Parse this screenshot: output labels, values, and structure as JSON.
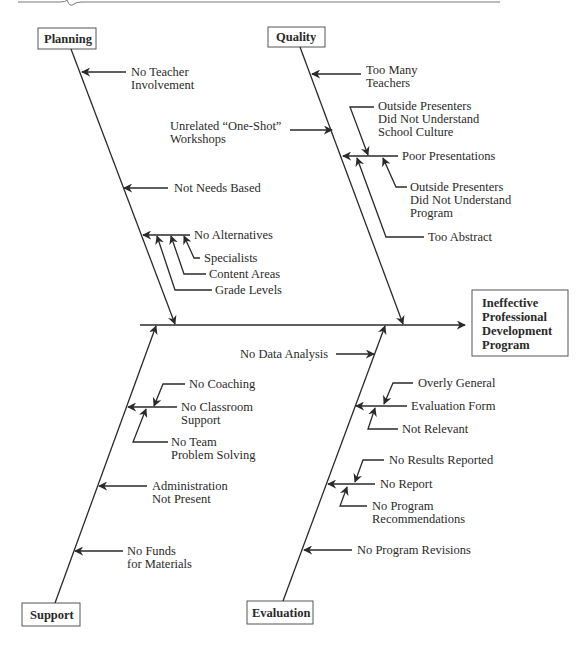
{
  "diagram": {
    "type": "fishbone",
    "effect": {
      "lines": [
        "Ineffective",
        "Professional",
        "Development",
        "Program"
      ]
    },
    "categories": {
      "planning": {
        "label": "Planning",
        "causes": [
          {
            "lines": [
              "No Teacher",
              "Involvement"
            ]
          },
          {
            "lines": [
              "Not Needs Based"
            ]
          },
          {
            "lines": [
              "No Alternatives"
            ],
            "sub_causes": [
              {
                "lines": [
                  "Specialists"
                ]
              },
              {
                "lines": [
                  "Content Areas"
                ]
              },
              {
                "lines": [
                  "Grade Levels"
                ]
              }
            ]
          }
        ]
      },
      "quality": {
        "label": "Quality",
        "causes": [
          {
            "lines": [
              "Too Many",
              "Teachers"
            ]
          },
          {
            "lines": [
              "Unrelated “One-Shot”",
              "Workshops"
            ]
          },
          {
            "lines": [
              "Poor Presentations"
            ],
            "sub_causes": [
              {
                "lines": [
                  "Outside Presenters",
                  "Did Not Understand",
                  "School Culture"
                ]
              },
              {
                "lines": [
                  "Outside Presenters",
                  "Did Not Understand",
                  "Program"
                ]
              },
              {
                "lines": [
                  "Too Abstract"
                ]
              }
            ]
          }
        ]
      },
      "support": {
        "label": "Support",
        "causes": [
          {
            "lines": [
              "No Classroom",
              "Support"
            ],
            "sub_causes": [
              {
                "lines": [
                  "No Coaching"
                ]
              },
              {
                "lines": [
                  "No Team",
                  "Problem Solving"
                ]
              }
            ]
          },
          {
            "lines": [
              "Administration",
              "Not Present"
            ]
          },
          {
            "lines": [
              "No Funds",
              "for Materials"
            ]
          }
        ]
      },
      "evaluation": {
        "label": "Evaluation",
        "causes": [
          {
            "lines": [
              "No Data Analysis"
            ]
          },
          {
            "lines": [
              "Evaluation Form"
            ],
            "sub_causes": [
              {
                "lines": [
                  "Overly General"
                ]
              },
              {
                "lines": [
                  "Not Relevant"
                ]
              }
            ]
          },
          {
            "lines": [
              "No Report"
            ],
            "sub_causes": [
              {
                "lines": [
                  "No Results Reported"
                ]
              },
              {
                "lines": [
                  "No Program",
                  "Recommendations"
                ]
              }
            ]
          },
          {
            "lines": [
              "No Program Revisions"
            ]
          }
        ]
      }
    },
    "colors": {
      "line": "#2a2a2a",
      "box_border": "#555555",
      "background": "#ffffff"
    }
  }
}
